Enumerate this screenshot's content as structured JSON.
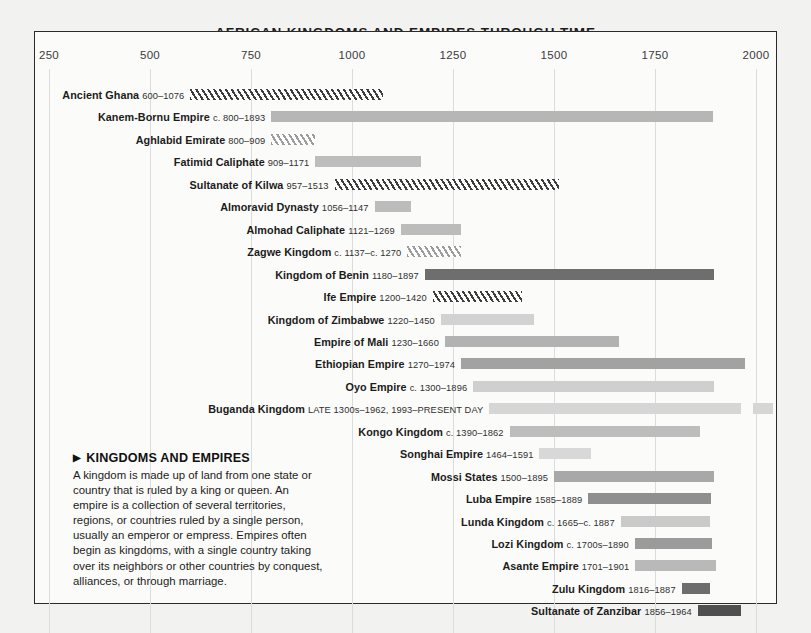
{
  "chart_title": "AFRICAN KINGDOMS AND EMPIRES THROUGH TIME",
  "axis": {
    "ticks": [
      "250",
      "500",
      "750",
      "1000",
      "1250",
      "1500",
      "1750",
      "2000"
    ]
  },
  "infobox": {
    "arrow": "▶",
    "title": "KINGDOMS AND EMPIRES",
    "body": "A kingdom is made up of land from one state or country that is ruled by a king or queen. An empire is a collection of several territories, regions, or countries ruled by a single person, usually an emperor or empress. Empires often begin as kingdoms, with a single country taking over its neighbors or other countries by conquest, alliances, or through marriage."
  },
  "chart_data": {
    "type": "bar",
    "subtype": "timeline-gantt",
    "title": "AFRICAN KINGDOMS AND EMPIRES THROUGH TIME",
    "xlabel": "",
    "ylabel": "",
    "xlim": [
      250,
      2000
    ],
    "xticks": [
      250,
      500,
      750,
      1000,
      1250,
      1500,
      1750,
      2000
    ],
    "grid": "vertical",
    "legend": "none",
    "categories": [
      "Ancient Ghana",
      "Kanem-Bornu Empire",
      "Aghlabid Emirate",
      "Fatimid Caliphate",
      "Sultanate of Kilwa",
      "Almoravid Dynasty",
      "Almohad Caliphate",
      "Zagwe Kingdom",
      "Kingdom of Benin",
      "Ife Empire",
      "Kingdom of Zimbabwe",
      "Empire of Mali",
      "Ethiopian Empire",
      "Oyo Empire",
      "Buganda Kingdom",
      "Kongo Kingdom",
      "Songhai Empire",
      "Mossi States",
      "Luba Empire",
      "Lunda Kingdom",
      "Lozi Kingdom",
      "Asante Empire",
      "Zulu Kingdom",
      "Sultanate of Zanzibar"
    ],
    "bars": [
      {
        "name": "Ancient Ghana",
        "dates": "600–1076",
        "start": 600,
        "end": 1076,
        "fill": "hatch-dark",
        "color": "#3d3d3d"
      },
      {
        "name": "Kanem-Bornu Empire",
        "dates": "c. 800–1893",
        "start": 800,
        "end": 1893,
        "fill": "solid",
        "color": "#b6b6b6"
      },
      {
        "name": "Aghlabid Emirate",
        "dates": "800–909",
        "start": 800,
        "end": 909,
        "fill": "hatch-light",
        "color": "#9c9c9c"
      },
      {
        "name": "Fatimid Caliphate",
        "dates": "909–1171",
        "start": 909,
        "end": 1171,
        "fill": "solid",
        "color": "#bdbdbd"
      },
      {
        "name": "Sultanate of Kilwa",
        "dates": "957–1513",
        "start": 957,
        "end": 1513,
        "fill": "hatch-dark",
        "color": "#3d3d3d"
      },
      {
        "name": "Almoravid Dynasty",
        "dates": "1056–1147",
        "start": 1056,
        "end": 1147,
        "fill": "solid",
        "color": "#bcbcbc"
      },
      {
        "name": "Almohad Caliphate",
        "dates": "1121–1269",
        "start": 1121,
        "end": 1269,
        "fill": "solid",
        "color": "#bcbcbc"
      },
      {
        "name": "Zagwe Kingdom",
        "dates": "c. 1137–c. 1270",
        "start": 1137,
        "end": 1270,
        "fill": "hatch-light",
        "color": "#9c9c9c"
      },
      {
        "name": "Kingdom of Benin",
        "dates": "1180–1897",
        "start": 1180,
        "end": 1897,
        "fill": "solid",
        "color": "#6e6e6e"
      },
      {
        "name": "Ife Empire",
        "dates": "1200–1420",
        "start": 1200,
        "end": 1420,
        "fill": "hatch-dark",
        "color": "#3d3d3d"
      },
      {
        "name": "Kingdom of Zimbabwe",
        "dates": "1220–1450",
        "start": 1220,
        "end": 1450,
        "fill": "solid",
        "color": "#d2d2d2"
      },
      {
        "name": "Empire of Mali",
        "dates": "1230–1660",
        "start": 1230,
        "end": 1660,
        "fill": "solid",
        "color": "#b2b2b2"
      },
      {
        "name": "Ethiopian Empire",
        "dates": "1270–1974",
        "start": 1270,
        "end": 1974,
        "fill": "solid",
        "color": "#a2a2a2"
      },
      {
        "name": "Oyo Empire",
        "dates": "c. 1300–1896",
        "start": 1300,
        "end": 1896,
        "fill": "solid",
        "color": "#cfcfcf"
      },
      {
        "name": "Buganda Kingdom",
        "dates": "LATE 1300s–1962, 1993–PRESENT DAY",
        "start": 1340,
        "end": 1962,
        "fill": "solid",
        "color": "#d6d6d6",
        "segment2_start": 1993,
        "segment2_end": 2043
      },
      {
        "name": "Kongo Kingdom",
        "dates": "c. 1390–1862",
        "start": 1390,
        "end": 1862,
        "fill": "solid",
        "color": "#bdbdbd"
      },
      {
        "name": "Songhai Empire",
        "dates": "1464–1591",
        "start": 1464,
        "end": 1591,
        "fill": "solid",
        "color": "#d8d8d8"
      },
      {
        "name": "Mossi States",
        "dates": "1500–1895",
        "start": 1500,
        "end": 1895,
        "fill": "solid",
        "color": "#a8a8a8"
      },
      {
        "name": "Luba Empire",
        "dates": "1585–1889",
        "start": 1585,
        "end": 1889,
        "fill": "solid",
        "color": "#8f8f8f"
      },
      {
        "name": "Lunda Kingdom",
        "dates": "c. 1665–c. 1887",
        "start": 1665,
        "end": 1887,
        "fill": "solid",
        "color": "#cacaca"
      },
      {
        "name": "Lozi Kingdom",
        "dates": "c. 1700s–1890",
        "start": 1700,
        "end": 1890,
        "fill": "solid",
        "color": "#9b9b9b"
      },
      {
        "name": "Asante Empire",
        "dates": "1701–1901",
        "start": 1701,
        "end": 1901,
        "fill": "solid",
        "color": "#b9b9b9"
      },
      {
        "name": "Zulu Kingdom",
        "dates": "1816–1887",
        "start": 1816,
        "end": 1887,
        "fill": "solid",
        "color": "#6d6d6d"
      },
      {
        "name": "Sultanate of Zanzibar",
        "dates": "1856–1964",
        "start": 1856,
        "end": 1964,
        "fill": "solid",
        "color": "#4f4f4f"
      }
    ]
  }
}
